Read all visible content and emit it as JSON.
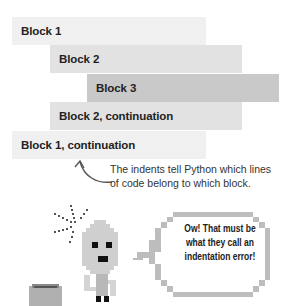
{
  "blocks": [
    {
      "label": "Block 1",
      "level": 1,
      "color": "#f0f0f0"
    },
    {
      "label": "Block 2",
      "level": 2,
      "color": "#e2e2e2"
    },
    {
      "label": "Block 3",
      "level": 3,
      "color": "#c9c9c9"
    },
    {
      "label": "Block 2, continuation",
      "level": 2,
      "color": "#e2e2e2"
    },
    {
      "label": "Block 1, continuation",
      "level": 1,
      "color": "#f0f0f0"
    }
  ],
  "annotation": {
    "line1": "The indents tell Python which lines",
    "line2": "of code belong to which block."
  },
  "speech_bubble": {
    "line1": "Ow! That must be",
    "line2": "what they call an",
    "line3": "indentation error!"
  },
  "icons": {
    "arrow": "curved-arrow-icon",
    "robot": "pixel-robot-icon",
    "impact": "impact-burst-icon",
    "box": "box-icon"
  }
}
